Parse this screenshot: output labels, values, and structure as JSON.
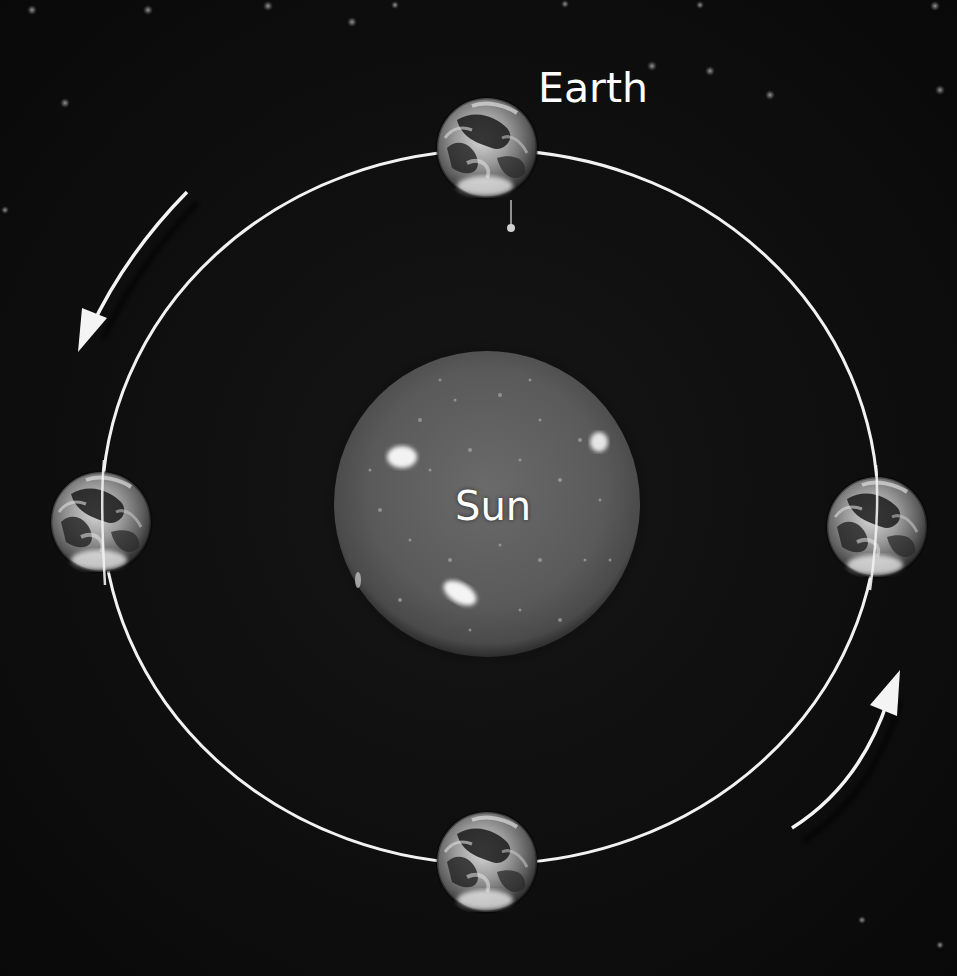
{
  "labels": {
    "earth": "Earth",
    "sun": "Sun"
  },
  "diagram": {
    "type": "orbit-diagram",
    "central_body": {
      "name": "Sun",
      "cx": 487,
      "cy": 504,
      "r": 153
    },
    "orbit": {
      "cx": 490,
      "cy": 507,
      "rx": 388,
      "ry": 357,
      "color": "#f2f2f2"
    },
    "earth_positions": [
      {
        "id": "top",
        "cx": 487,
        "cy": 148,
        "r": 50
      },
      {
        "id": "left",
        "cx": 101,
        "cy": 522,
        "r": 50
      },
      {
        "id": "right",
        "cx": 877,
        "cy": 527,
        "r": 50
      },
      {
        "id": "bottom",
        "cx": 487,
        "cy": 862,
        "r": 50
      }
    ],
    "direction_arrows": [
      {
        "id": "upper-left",
        "direction": "counter-clockwise"
      },
      {
        "id": "lower-right",
        "direction": "counter-clockwise"
      }
    ]
  },
  "colors": {
    "background": "#0d0d0d",
    "orbit_line": "#f2f2f2",
    "arrow": "#f4f4f4",
    "label_text": "#ffffff",
    "sun_surface": "#5c5c5c"
  }
}
